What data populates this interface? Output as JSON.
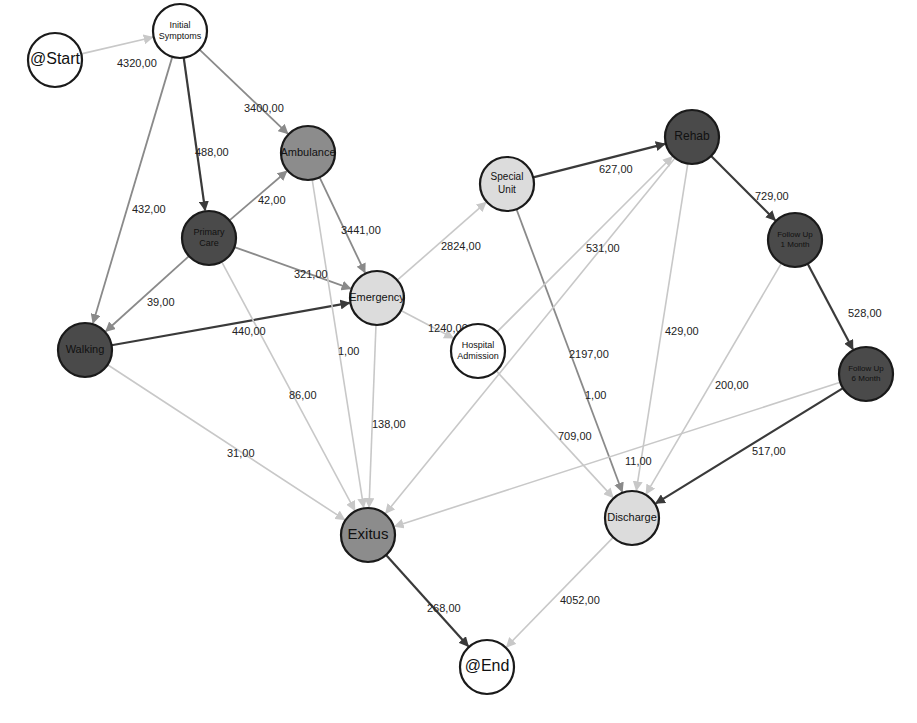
{
  "diagram": {
    "type": "process-flow-graph",
    "colors": {
      "white_node": "#ffffff",
      "light_node": "#dcdcdc",
      "mid_node": "#8c8c8c",
      "dark_node": "#4a4a4a",
      "node_stroke": "#1a1a1a",
      "edge_dark": "#3a3a3a",
      "edge_mid": "#8a8a8a",
      "edge_light": "#c8c8c8"
    },
    "nodes": [
      {
        "id": "start",
        "label": "@Start",
        "lines": [
          "@Start"
        ],
        "x": 55,
        "y": 60,
        "r": 27,
        "fill": "white_node",
        "font": 16
      },
      {
        "id": "initial",
        "label": "Initial Symptoms",
        "lines": [
          "Initial",
          "Symptoms"
        ],
        "x": 180,
        "y": 31,
        "r": 27,
        "fill": "white_node",
        "font": 9
      },
      {
        "id": "ambulance",
        "label": "Ambulance",
        "lines": [
          "Ambulance"
        ],
        "x": 308,
        "y": 153,
        "r": 27,
        "fill": "mid_node",
        "font": 11
      },
      {
        "id": "primary",
        "label": "Primary Care",
        "lines": [
          "Primary",
          "Care"
        ],
        "x": 209,
        "y": 238,
        "r": 27,
        "fill": "dark_node",
        "font": 9
      },
      {
        "id": "walking",
        "label": "Walking",
        "lines": [
          "Walking"
        ],
        "x": 85,
        "y": 350,
        "r": 27,
        "fill": "dark_node",
        "font": 11
      },
      {
        "id": "emergency",
        "label": "Emergency",
        "lines": [
          "Emergency"
        ],
        "x": 377,
        "y": 298,
        "r": 27,
        "fill": "light_node",
        "font": 11
      },
      {
        "id": "special",
        "label": "Special Unit",
        "lines": [
          "Special",
          "Unit"
        ],
        "x": 507,
        "y": 184,
        "r": 27,
        "fill": "light_node",
        "font": 10
      },
      {
        "id": "rehab",
        "label": "Rehab",
        "lines": [
          "Rehab"
        ],
        "x": 692,
        "y": 137,
        "r": 27,
        "fill": "dark_node",
        "font": 12
      },
      {
        "id": "hospital",
        "label": "Hospital Admission",
        "lines": [
          "Hospital",
          "Admission"
        ],
        "x": 478,
        "y": 351,
        "r": 27,
        "fill": "white_node",
        "font": 9
      },
      {
        "id": "followup1",
        "label": "Follow Up 1 Month",
        "lines": [
          "Follow Up",
          "1 Month"
        ],
        "x": 795,
        "y": 240,
        "r": 27,
        "fill": "dark_node",
        "font": 8
      },
      {
        "id": "followup6",
        "label": "Follow Up 6 Month",
        "lines": [
          "Follow Up",
          "6 Month"
        ],
        "x": 866,
        "y": 374,
        "r": 27,
        "fill": "dark_node",
        "font": 8
      },
      {
        "id": "exitus",
        "label": "Exitus",
        "lines": [
          "Exitus"
        ],
        "x": 368,
        "y": 535,
        "r": 27,
        "fill": "mid_node",
        "font": 15
      },
      {
        "id": "discharge",
        "label": "Discharge",
        "lines": [
          "Discharge"
        ],
        "x": 632,
        "y": 518,
        "r": 27,
        "fill": "light_node",
        "font": 11
      },
      {
        "id": "end",
        "label": "@End",
        "lines": [
          "@End"
        ],
        "x": 487,
        "y": 667,
        "r": 27,
        "fill": "white_node",
        "font": 16
      }
    ],
    "edges": [
      {
        "from": "start",
        "to": "initial",
        "value": "4320,00",
        "tone": "edge_light",
        "lx": 117,
        "ly": 67
      },
      {
        "from": "initial",
        "to": "ambulance",
        "value": "3400,00",
        "tone": "edge_mid",
        "lx": 244,
        "ly": 112
      },
      {
        "from": "initial",
        "to": "primary",
        "value": "488,00",
        "tone": "edge_dark",
        "lx": 195,
        "ly": 156
      },
      {
        "from": "initial",
        "to": "walking",
        "value": "432,00",
        "tone": "edge_mid",
        "lx": 132,
        "ly": 213
      },
      {
        "from": "primary",
        "to": "ambulance",
        "value": "42,00",
        "tone": "edge_mid",
        "lx": 258,
        "ly": 204
      },
      {
        "from": "primary",
        "to": "emergency",
        "value": "321,00",
        "tone": "edge_mid",
        "lx": 294,
        "ly": 278
      },
      {
        "from": "primary",
        "to": "walking",
        "value": "39,00",
        "tone": "edge_mid",
        "lx": 147,
        "ly": 306
      },
      {
        "from": "walking",
        "to": "emergency",
        "value": "440,00",
        "tone": "edge_dark",
        "lx": 232,
        "ly": 335
      },
      {
        "from": "ambulance",
        "to": "emergency",
        "value": "3441,00",
        "tone": "edge_mid",
        "lx": 341,
        "ly": 234
      },
      {
        "from": "ambulance",
        "to": "exitus",
        "value": "1,00",
        "tone": "edge_light",
        "lx": 338,
        "ly": 355
      },
      {
        "from": "primary",
        "to": "exitus",
        "value": "86,00",
        "tone": "edge_light",
        "lx": 289,
        "ly": 399
      },
      {
        "from": "walking",
        "to": "exitus",
        "value": "31,00",
        "tone": "edge_light",
        "lx": 227,
        "ly": 457
      },
      {
        "from": "emergency",
        "to": "exitus",
        "value": "138,00",
        "tone": "edge_light",
        "lx": 372,
        "ly": 428
      },
      {
        "from": "emergency",
        "to": "special",
        "value": "2824,00",
        "tone": "edge_light",
        "lx": 441,
        "ly": 250
      },
      {
        "from": "emergency",
        "to": "hospital",
        "value": "1240,00",
        "tone": "edge_light",
        "lx": 428,
        "ly": 332
      },
      {
        "from": "special",
        "to": "rehab",
        "value": "627,00",
        "tone": "edge_dark",
        "lx": 599,
        "ly": 173
      },
      {
        "from": "special",
        "to": "discharge",
        "value": "2197,00",
        "tone": "edge_mid",
        "lx": 569,
        "ly": 358
      },
      {
        "from": "hospital",
        "to": "rehab",
        "value": "531,00",
        "tone": "edge_light",
        "lx": 586,
        "ly": 252
      },
      {
        "from": "hospital",
        "to": "discharge",
        "value": "709,00",
        "tone": "edge_light",
        "lx": 558,
        "ly": 440
      },
      {
        "from": "rehab",
        "to": "followup1",
        "value": "729,00",
        "tone": "edge_dark",
        "lx": 755,
        "ly": 200
      },
      {
        "from": "rehab",
        "to": "discharge",
        "value": "429,00",
        "tone": "edge_light",
        "lx": 665,
        "ly": 335
      },
      {
        "from": "rehab",
        "to": "exitus",
        "value": "1,00",
        "tone": "edge_light",
        "lx": 585,
        "ly": 399
      },
      {
        "from": "followup1",
        "to": "followup6",
        "value": "528,00",
        "tone": "edge_dark",
        "lx": 848,
        "ly": 317
      },
      {
        "from": "followup1",
        "to": "discharge",
        "value": "200,00",
        "tone": "edge_light",
        "lx": 715,
        "ly": 389
      },
      {
        "from": "followup6",
        "to": "exitus",
        "value": "11,00",
        "tone": "edge_light",
        "lx": 625,
        "ly": 465
      },
      {
        "from": "followup6",
        "to": "discharge",
        "value": "517,00",
        "tone": "edge_dark",
        "lx": 752,
        "ly": 455
      },
      {
        "from": "exitus",
        "to": "end",
        "value": "268,00",
        "tone": "edge_dark",
        "lx": 427,
        "ly": 612
      },
      {
        "from": "discharge",
        "to": "end",
        "value": "4052,00",
        "tone": "edge_light",
        "lx": 560,
        "ly": 604
      }
    ]
  }
}
